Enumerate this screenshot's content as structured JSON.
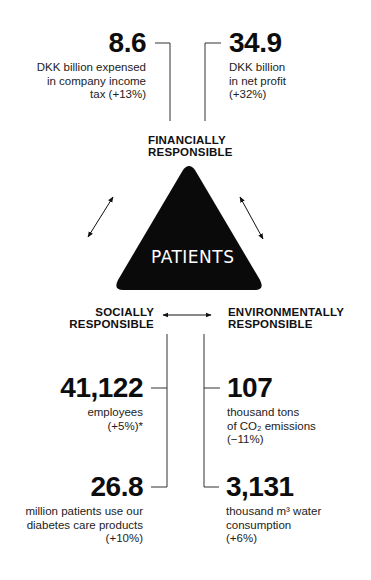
{
  "financial": {
    "heading_line1": "FINANCIALLY",
    "heading_line2": "RESPONSIBLE",
    "metrics": [
      {
        "value": "8.6",
        "line1": "DKK billion expensed",
        "line2": "in company income",
        "line3": "tax (+13%)"
      },
      {
        "value": "34.9",
        "line1": "DKK billion",
        "line2": "in net profit",
        "line3": "(+32%)"
      }
    ]
  },
  "center": {
    "label": "PATIENTS",
    "shape_color": "#0a0a0a"
  },
  "social": {
    "heading_line1": "SOCIALLY",
    "heading_line2": "RESPONSIBLE",
    "metrics": [
      {
        "value": "41,122",
        "line1": "employees",
        "line2": "(+5%)*"
      },
      {
        "value": "26.8",
        "line1": "million patients use our",
        "line2": "diabetes care products",
        "line3": "(+10%)"
      }
    ]
  },
  "environmental": {
    "heading_line1": "ENVIRONMENTALLY",
    "heading_line2": "RESPONSIBLE",
    "metrics": [
      {
        "value": "107",
        "line1": "thousand tons",
        "line2": "of CO₂ emissions",
        "line3": "(−11%)"
      },
      {
        "value": "3,131",
        "line1": "thousand m³ water",
        "line2": "consumption",
        "line3": "(+6%)"
      }
    ]
  }
}
